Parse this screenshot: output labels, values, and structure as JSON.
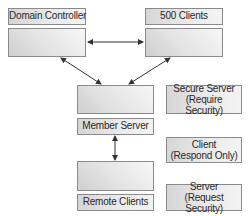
{
  "nodes": {
    "domain_controller": {
      "label": "Domain Controller"
    },
    "clients_500": {
      "label": "500 Clients"
    },
    "member_server": {
      "label": "Member Server"
    },
    "remote_clients": {
      "label": "Remote Clients"
    }
  },
  "legend": [
    {
      "line1": "Secure Server",
      "line2": "(Require Security)"
    },
    {
      "line1": "Client",
      "line2": "(Respond Only)"
    },
    {
      "line1": "Server",
      "line2": "(Request Security)"
    }
  ],
  "connections": [
    {
      "from": "domain_controller",
      "to": "clients_500",
      "type": "bidirectional"
    },
    {
      "from": "domain_controller",
      "to": "member_server",
      "type": "bidirectional"
    },
    {
      "from": "clients_500",
      "to": "member_server",
      "type": "bidirectional"
    },
    {
      "from": "member_server",
      "to": "remote_clients",
      "type": "bidirectional"
    }
  ],
  "colors": {
    "border": "#8a8a8a",
    "arrow": "#333333",
    "fill_dark": "#cfcfcf",
    "fill_light": "#f7f7f7"
  }
}
